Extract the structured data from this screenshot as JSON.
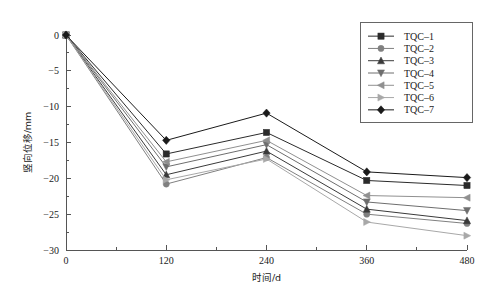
{
  "chart_data": {
    "type": "line",
    "title": "",
    "xlabel": "时间/d",
    "ylabel": "竖向位移/mm",
    "x": [
      0,
      120,
      240,
      360,
      480
    ],
    "xticks": [
      "0",
      "120",
      "240",
      "360",
      "480"
    ],
    "yticks": [
      "0",
      "−5",
      "−10",
      "−15",
      "−20",
      "−25",
      "−30"
    ],
    "ytick_values": [
      0,
      -5,
      -10,
      -15,
      -20,
      -25,
      -30
    ],
    "xlim": [
      0,
      480
    ],
    "ylim": [
      -30,
      0
    ],
    "grid": false,
    "legend_position": "top-right",
    "series": [
      {
        "name": "TQC-1",
        "marker": "square",
        "color": "#2b2b2b",
        "values": [
          0,
          -16.6,
          -13.6,
          -20.3,
          -21.0
        ]
      },
      {
        "name": "TQC-2",
        "marker": "circle",
        "color": "#808080",
        "values": [
          0,
          -20.8,
          -17.1,
          -25.0,
          -26.3
        ]
      },
      {
        "name": "TQC-3",
        "marker": "triangle-up",
        "color": "#3a3a3a",
        "values": [
          0,
          -19.5,
          -16.2,
          -24.3,
          -25.9
        ]
      },
      {
        "name": "TQC-4",
        "marker": "triangle-down",
        "color": "#6e6e6e",
        "values": [
          0,
          -18.4,
          -15.3,
          -23.3,
          -24.5
        ]
      },
      {
        "name": "TQC-5",
        "marker": "triangle-left",
        "color": "#909090",
        "values": [
          0,
          -17.7,
          -14.7,
          -22.4,
          -22.7
        ]
      },
      {
        "name": "TQC-6",
        "marker": "triangle-right",
        "color": "#a8a8a8",
        "values": [
          0,
          -20.2,
          -17.3,
          -26.1,
          -28.0
        ]
      },
      {
        "name": "TQC-7",
        "marker": "diamond",
        "color": "#1a1a1a",
        "values": [
          0,
          -14.7,
          -10.9,
          -19.1,
          -19.9
        ]
      }
    ]
  }
}
